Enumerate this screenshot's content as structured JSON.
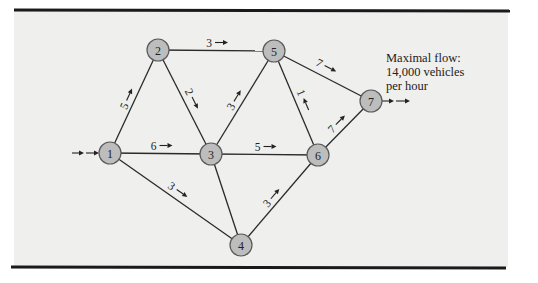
{
  "figure": {
    "background": "#efefee",
    "node_fill": "#bdbdbd",
    "rules": [
      {
        "x1": 14,
        "y1": 10,
        "x2": 510,
        "y2": 11
      },
      {
        "x1": 11,
        "y1": 267,
        "x2": 506,
        "y2": 268
      }
    ],
    "panel": {
      "x": 14,
      "y": 11,
      "width": 494,
      "height": 256
    }
  },
  "nodes": [
    {
      "id": "1",
      "label": "1",
      "x": 110,
      "y": 153
    },
    {
      "id": "2",
      "label": "2",
      "x": 158,
      "y": 50
    },
    {
      "id": "3",
      "label": "3",
      "x": 211,
      "y": 154
    },
    {
      "id": "4",
      "label": "4",
      "x": 241,
      "y": 245
    },
    {
      "id": "5",
      "label": "5",
      "x": 274,
      "y": 51
    },
    {
      "id": "6",
      "label": "6",
      "x": 318,
      "y": 155
    },
    {
      "id": "7",
      "label": "7",
      "x": 371,
      "y": 101
    }
  ],
  "edges": [
    {
      "from": "1",
      "to": "2",
      "flow": "5",
      "direction": "forward"
    },
    {
      "from": "1",
      "to": "3",
      "flow": "6",
      "direction": "forward"
    },
    {
      "from": "1",
      "to": "4",
      "flow": "3",
      "direction": "forward"
    },
    {
      "from": "2",
      "to": "5",
      "flow": "3",
      "direction": "forward"
    },
    {
      "from": "2",
      "to": "3",
      "flow": "2",
      "direction": "forward"
    },
    {
      "from": "3",
      "to": "5",
      "flow": "3",
      "direction": "forward"
    },
    {
      "from": "3",
      "to": "6",
      "flow": "5",
      "direction": "forward"
    },
    {
      "from": "3",
      "to": "4",
      "flow": "",
      "direction": "none"
    },
    {
      "from": "4",
      "to": "6",
      "flow": "3",
      "direction": "forward"
    },
    {
      "from": "5",
      "to": "6",
      "flow": "1",
      "direction": "backward"
    },
    {
      "from": "5",
      "to": "7",
      "flow": "7",
      "direction": "forward"
    },
    {
      "from": "6",
      "to": "7",
      "flow": "7",
      "direction": "forward"
    }
  ],
  "source_arrows": {
    "x1": 72,
    "x2": 100,
    "y": 153
  },
  "sink_arrows": {
    "x1": 382,
    "x2": 410,
    "y": 101
  },
  "annotation": {
    "lines": [
      "Maximal flow:",
      "14,000 vehicles",
      "per hour"
    ],
    "x": 386,
    "y": 62,
    "line_height": 14
  }
}
